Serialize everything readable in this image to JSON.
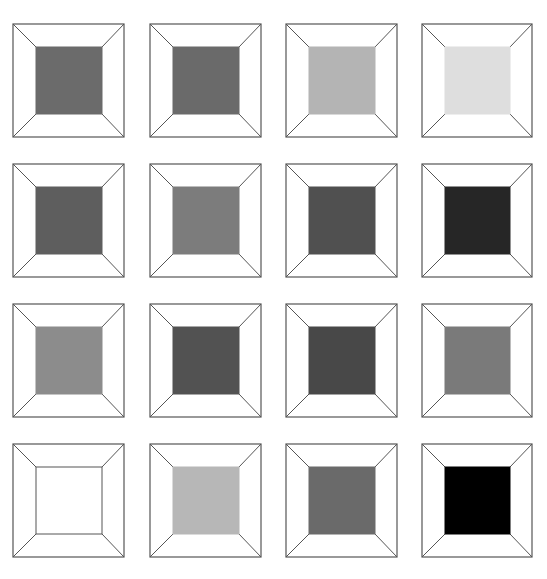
{
  "figure": {
    "stroke_color": "#555555",
    "rows": [
      {
        "cells": [
          {
            "fill": "#6b6b6b"
          },
          {
            "fill": "#6a6a6a"
          },
          {
            "fill": "#b4b4b4"
          },
          {
            "fill": "#dedede"
          }
        ]
      },
      {
        "cells": [
          {
            "fill": "#5e5e5e"
          },
          {
            "fill": "#7c7c7c"
          },
          {
            "fill": "#505050"
          },
          {
            "fill": "#262626"
          }
        ]
      },
      {
        "cells": [
          {
            "fill": "#8c8c8c"
          },
          {
            "fill": "#525252"
          },
          {
            "fill": "#484848"
          },
          {
            "fill": "#7a7a7a"
          }
        ]
      },
      {
        "cells": [
          {
            "fill": "#ffffff"
          },
          {
            "fill": "#b7b7b7"
          },
          {
            "fill": "#6a6a6a"
          },
          {
            "fill": "#000000"
          }
        ]
      }
    ]
  }
}
